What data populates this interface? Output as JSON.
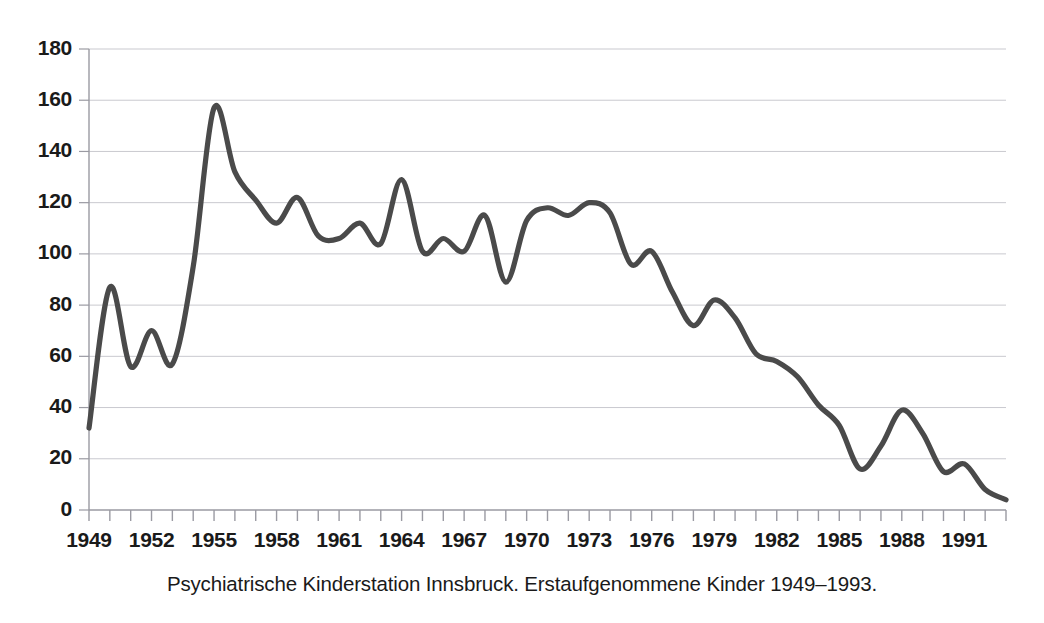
{
  "caption": "Psychiatrische Kinderstation Innsbruck. Erstaufgenommene Kinder 1949–1993.",
  "style": {
    "line_color": "#4a4a4a",
    "grid_color": "#c9c9cf",
    "axis_color": "#9a9aa2",
    "text_color": "#1a1a1a",
    "background": "#ffffff",
    "line_width": 5.2
  },
  "chart_data": {
    "type": "line",
    "title": "",
    "subtitle": "",
    "xlabel": "",
    "ylabel": "",
    "xlim": [
      1949,
      1993
    ],
    "ylim": [
      0,
      180
    ],
    "grid": true,
    "legend": false,
    "legend_position": "none",
    "yticks": [
      0,
      20,
      40,
      60,
      80,
      100,
      120,
      140,
      160,
      180
    ],
    "ytick_labels": [
      "0",
      "20",
      "40",
      "60",
      "80",
      "100",
      "120",
      "140",
      "160",
      "180"
    ],
    "xticks": [
      1949,
      1952,
      1955,
      1958,
      1961,
      1964,
      1967,
      1970,
      1973,
      1976,
      1979,
      1982,
      1985,
      1988,
      1991
    ],
    "xtick_labels": [
      "1949",
      "1952",
      "1955",
      "1958",
      "1961",
      "1964",
      "1967",
      "1970",
      "1973",
      "1976",
      "1979",
      "1982",
      "1985",
      "1988",
      "1991"
    ],
    "xtick_minor_step": 1,
    "x": [
      1949,
      1950,
      1951,
      1952,
      1953,
      1954,
      1955,
      1956,
      1957,
      1958,
      1959,
      1960,
      1961,
      1962,
      1963,
      1964,
      1965,
      1966,
      1967,
      1968,
      1969,
      1970,
      1971,
      1972,
      1973,
      1974,
      1975,
      1976,
      1977,
      1978,
      1979,
      1980,
      1981,
      1982,
      1983,
      1984,
      1985,
      1986,
      1987,
      1988,
      1989,
      1990,
      1991,
      1992,
      1993
    ],
    "values": [
      32,
      87,
      56,
      70,
      57,
      95,
      157,
      132,
      121,
      112,
      122,
      107,
      106,
      112,
      104,
      129,
      101,
      106,
      101,
      115,
      89,
      113,
      118,
      115,
      120,
      116,
      96,
      101,
      85,
      72,
      82,
      75,
      61,
      58,
      52,
      41,
      33,
      16,
      25,
      39,
      30,
      15,
      18,
      8,
      4
    ],
    "series": [
      {
        "name": "Erstaufgenommene Kinder",
        "values": [
          32,
          87,
          56,
          70,
          57,
          95,
          157,
          132,
          121,
          112,
          122,
          107,
          106,
          112,
          104,
          129,
          101,
          106,
          101,
          115,
          89,
          113,
          118,
          115,
          120,
          116,
          96,
          101,
          85,
          72,
          82,
          75,
          61,
          58,
          52,
          41,
          33,
          16,
          25,
          39,
          30,
          15,
          18,
          8,
          4
        ]
      }
    ]
  }
}
